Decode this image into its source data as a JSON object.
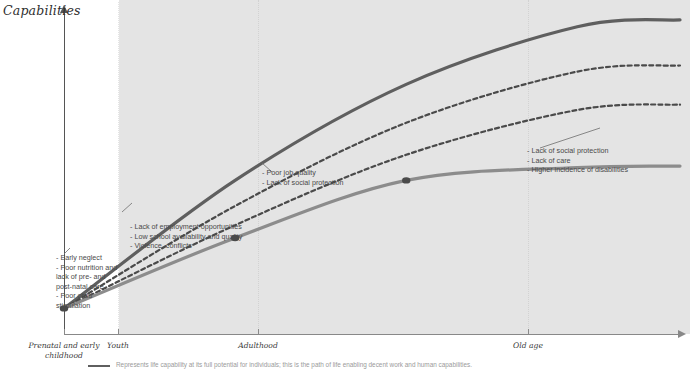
{
  "chart_data": {
    "type": "line",
    "title": "",
    "ylabel": "Capabilities",
    "xlabel": "",
    "grid": true,
    "legend_position": "bottom-left",
    "x": [
      0,
      1,
      2,
      3
    ],
    "categories": [
      "Prenatal and early childhood",
      "Youth",
      "Adulthood",
      "Old age"
    ],
    "xlim": [
      0,
      3.6
    ],
    "ylim": [
      0,
      100
    ],
    "series": [
      {
        "name": "Full potential life capability",
        "style": "solid",
        "color": "#5f5f5f",
        "width": 3.2,
        "values": [
          8,
          48,
          78,
          96
        ]
      },
      {
        "name": "Reduced capability path (upper)",
        "style": "dashed",
        "color": "#4a4a4a",
        "width": 2.2,
        "values": [
          8,
          40,
          66,
          82
        ]
      },
      {
        "name": "Reduced capability path (lower)",
        "style": "dashed",
        "color": "#4a4a4a",
        "width": 2.2,
        "values": [
          8,
          34,
          56,
          70
        ]
      },
      {
        "name": "Deprived life-course capability",
        "style": "solid",
        "color": "#8c8c8c",
        "width": 3.2,
        "values": [
          8,
          30,
          48,
          52
        ]
      }
    ],
    "markers": [
      {
        "x": 0,
        "y": 8,
        "label": "origin-marker"
      },
      {
        "x": 1,
        "y": 30,
        "label": "youth-marker"
      },
      {
        "x": 2,
        "y": 48,
        "label": "adulthood-marker"
      }
    ]
  },
  "axes": {
    "y_label": "Capabilities",
    "x_ticks": [
      {
        "label_line1": "Prenatal and early",
        "label_line2": "childhood"
      },
      {
        "label_line1": "Youth",
        "label_line2": ""
      },
      {
        "label_line1": "Adulthood",
        "label_line2": ""
      },
      {
        "label_line1": "Old age",
        "label_line2": ""
      }
    ]
  },
  "annotations": [
    {
      "id": "early-childhood",
      "items": [
        "- Early neglect",
        "- Poor nutrition and",
        "   lack of pre- and",
        "   post-natal care",
        "- Poor child",
        "   stimulation"
      ]
    },
    {
      "id": "youth",
      "items": [
        "- Lack of employment opportunities",
        "- Low school availability and quality",
        "- Violence, conflicts"
      ]
    },
    {
      "id": "adulthood",
      "items": [
        "- Poor job quality",
        "- Lack of social protection"
      ]
    },
    {
      "id": "old-age",
      "items": [
        "- Lack of social protection",
        "- Lack of care",
        "- Higher incidence of disabilities"
      ]
    }
  ],
  "legend": {
    "caption": "Represents life capability at its full potential for individuals; this is the path of life enabling decent work and human capabilities."
  },
  "colors": {
    "band": "#e4e4e4",
    "curve_dark": "#5f5f5f",
    "curve_light": "#8c8c8c",
    "dashed": "#4a4a4a",
    "axis": "#888888",
    "text": "#4a4a4a"
  }
}
